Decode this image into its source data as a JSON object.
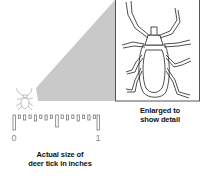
{
  "diagram": {
    "enlarged_caption": {
      "line1": "Enlarged to",
      "line2": "show detail"
    },
    "actual_caption": {
      "line1": "Actual size of",
      "line2": "deer tick in inches"
    },
    "ruler": {
      "label_start": "0",
      "label_end": "1",
      "unit": "inches"
    },
    "colors": {
      "beam": "#c8c8c8",
      "line": "#222222",
      "box_border": "#555555"
    }
  }
}
